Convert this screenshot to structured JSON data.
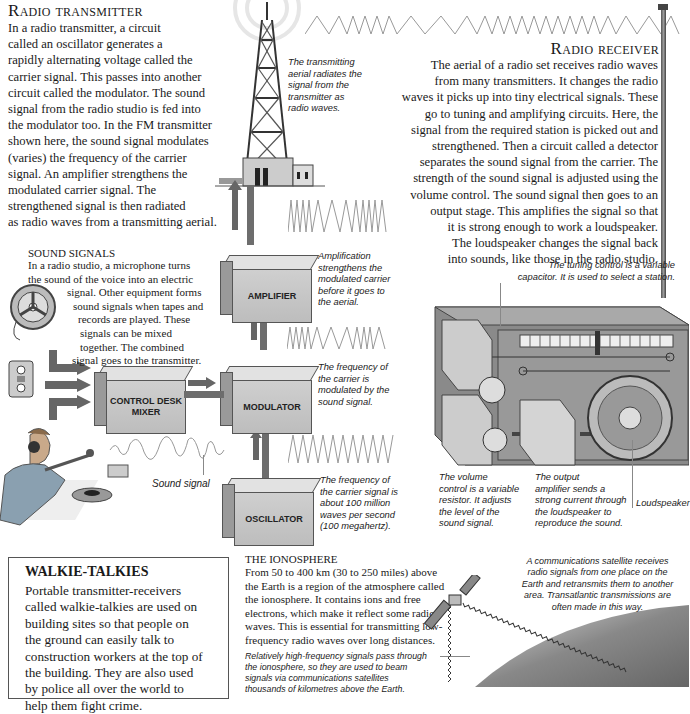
{
  "transmitter": {
    "title": "Radio transmitter",
    "body": "In a radio transmitter, a circuit called an oscillator generates a rapidly alternating voltage called the carrier signal. This passes into another circuit called the modulator. The sound signal from the radio studio is fed into the modulator too. In the FM transmitter shown here, the sound signal modulates (varies) the frequency of the carrier signal. An amplifier strengthens the modulated carrier signal. The strengthened signal is then radiated as radio waves from a transmitting aerial.",
    "lines": [
      "In a radio transmitter, a circuit",
      "called an oscillator generates a",
      "rapidly alternating voltage called the",
      "carrier signal. This passes into another",
      "circuit called the modulator. The sound",
      "signal from the radio studio is fed into",
      "the modulator too. In the FM transmitter",
      "shown here, the sound signal modulates",
      "(varies) the frequency of the carrier",
      "signal. An amplifier strengthens the",
      "modulated carrier signal. The",
      "strengthened signal is then radiated",
      "as radio waves from a transmitting aerial."
    ]
  },
  "receiver": {
    "title": "Radio receiver",
    "lines": [
      "The aerial of a radio set receives radio waves",
      "from many transmitters. It changes the radio",
      "waves it picks up into tiny electrical signals. These",
      "go to tuning and amplifying circuits. Here, the",
      "signal from the required station is picked out and",
      "strengthened. Then a circuit called a detector",
      "separates the sound signal from the carrier. The",
      "strength of the sound signal is adjusted using the",
      "volume control. The sound signal then goes to an",
      "output stage. This amplifies the signal so that",
      "it is strong enough to work a loudspeaker.",
      "The loudspeaker changes the signal back",
      "into sounds, like those in the radio studio."
    ]
  },
  "sound_signals": {
    "title": "SOUND SIGNALS",
    "lines": [
      "In a radio studio, a microphone turns",
      "the sound of the voice into an electric",
      "signal. Other equipment forms",
      "sound signals when tapes and",
      "records are played. These",
      "signals can be mixed",
      "together. The combined",
      "signal goes to the transmitter."
    ]
  },
  "blocks": {
    "amplifier": "AMPLIFIER",
    "control_desk_1": "CONTROL DESK",
    "control_desk_2": "MIXER",
    "modulator": "MODULATOR",
    "oscillator": "OSCILLATOR"
  },
  "captions": {
    "aerial": [
      "The transmitting",
      "aerial radiates the",
      "signal from the",
      "transmitter as",
      "radio waves."
    ],
    "amplification": [
      "Amplification",
      "strengthens the",
      "modulated carrier",
      "before it goes to",
      "the aerial."
    ],
    "modulated": [
      "The frequency of",
      "the carrier is",
      "modulated by the",
      "sound signal."
    ],
    "carrier": [
      "The frequency of",
      "the carrier signal is",
      "about 100 million",
      "waves per second",
      "(100 megahertz)."
    ],
    "sound_signal": "Sound signal",
    "tuning": [
      "The tuning control is a variable",
      "capacitor. It is used to select a station."
    ],
    "volume": [
      "The volume",
      "control is a variable",
      "resistor. It adjusts",
      "the level of the",
      "sound signal."
    ],
    "output": [
      "The output",
      "amplifier sends a",
      "strong current through",
      "the loudspeaker to",
      "reproduce the sound."
    ],
    "loudspeaker": "Loudspeaker",
    "satellite": [
      "A communications satellite receives",
      "radio signals from one place on the",
      "Earth and retransmits them to another",
      "area. Transatlantic transmissions are",
      "often made in this way."
    ],
    "high_freq": [
      "Relatively high-frequency signals pass through",
      "the ionosphere, so they are used to beam",
      "signals via communications satellites",
      "thousands of kilometres above the Earth."
    ]
  },
  "walkie": {
    "title": "WALKIE-TALKIES",
    "lines": [
      "Portable transmitter-receivers",
      "called walkie-talkies are used on",
      "building sites so that people on",
      "the ground can easily talk to",
      "construction workers at the top of",
      "the building. They are also used",
      "by police all over the world to",
      "help them fight crime."
    ]
  },
  "ionosphere": {
    "title": "THE IONOSPHERE",
    "lines": [
      "From 50 to 400 km (30 to 250 miles) above",
      "the Earth is a region of the atmosphere called",
      "the ionosphere. It contains ions and free",
      "electrons, which make it reflect some radio",
      "waves. This is essential for transmitting low-",
      "frequency radio waves over long distances."
    ]
  }
}
